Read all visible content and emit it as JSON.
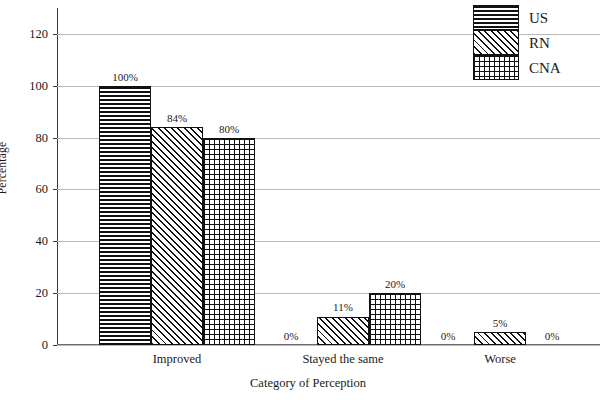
{
  "chart_data": {
    "type": "bar",
    "title": "",
    "xlabel": "Category of Perception",
    "ylabel": "Percentage",
    "categories": [
      "Improved",
      "Stayed the same",
      "Worse"
    ],
    "series": [
      {
        "name": "US",
        "pattern": "horizontal-stripes",
        "values": [
          100,
          0,
          0
        ],
        "labels": [
          "100%",
          "0%",
          "0%"
        ]
      },
      {
        "name": "RN",
        "pattern": "diagonal-hatch",
        "values": [
          84,
          11,
          5
        ],
        "labels": [
          "84%",
          "11%",
          "5%"
        ]
      },
      {
        "name": "CNA",
        "pattern": "crosshatch-grid",
        "values": [
          80,
          20,
          0
        ],
        "labels": [
          "80%",
          "20%",
          "0%"
        ]
      }
    ],
    "ylim": [
      0,
      130
    ],
    "yticks": [
      0,
      20,
      40,
      60,
      80,
      100,
      120
    ],
    "ytick_labels": [
      "0",
      "20",
      "40",
      "60",
      "80",
      "100",
      "120"
    ],
    "grid": true,
    "legend_position": "top-right",
    "legend_entries": [
      "US",
      "RN",
      "CNA"
    ],
    "colors": {
      "bar_outline": "#111111",
      "bar_fill": "#ffffff",
      "gridline": "#b9b9b9",
      "axis": "#3a3a3a",
      "text": "#1a1a1a"
    }
  }
}
